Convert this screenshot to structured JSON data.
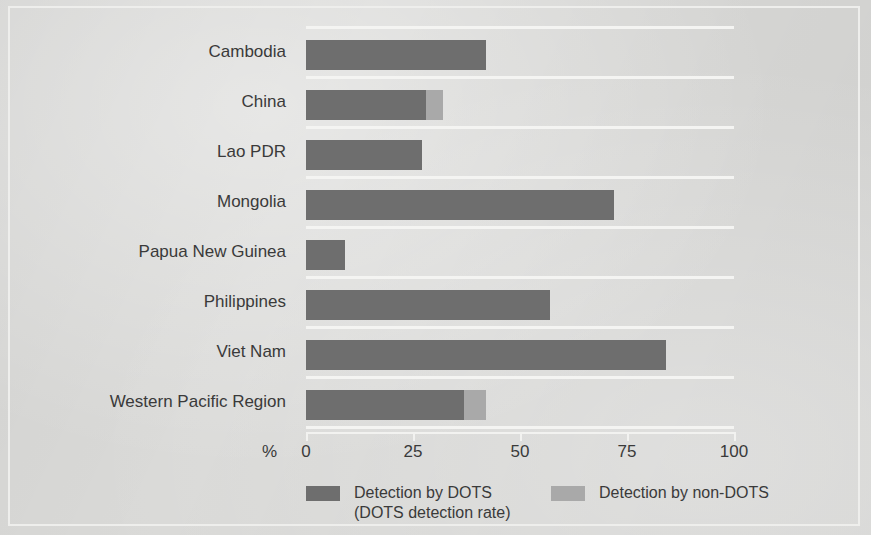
{
  "figure": {
    "background_color": "#d9d9d7",
    "frame_color": "#eeeeec"
  },
  "axis": {
    "unit_label": "%",
    "tick_labels": [
      "0",
      "25",
      "50",
      "75",
      "100"
    ]
  },
  "legend": {
    "items": [
      {
        "label": "Detection by DOTS",
        "sublabel": "(DOTS detection rate)",
        "color": "#6e6e6e",
        "swatch_name": "legend-swatch-dots"
      },
      {
        "label": "Detection by non-DOTS",
        "sublabel": "",
        "color": "#a9a9a9",
        "swatch_name": "legend-swatch-nondots"
      }
    ]
  },
  "chart_data": {
    "type": "bar",
    "orientation": "horizontal",
    "stacked": true,
    "title": "",
    "subtitle": "",
    "xlabel": "%",
    "ylabel": "",
    "xlim": [
      0,
      100
    ],
    "xticks": [
      0,
      25,
      50,
      75,
      100
    ],
    "grid": true,
    "grid_orientation": "horizontal",
    "legend_position": "bottom",
    "categories": [
      "Cambodia",
      "China",
      "Lao PDR",
      "Mongolia",
      "Papua New Guinea",
      "Philippines",
      "Viet Nam",
      "Western Pacific Region"
    ],
    "series": [
      {
        "name": "Detection by DOTS",
        "color": "#6e6e6e",
        "values": [
          42,
          28,
          27,
          72,
          9,
          57,
          84,
          37
        ]
      },
      {
        "name": "Detection by non-DOTS",
        "color": "#a9a9a9",
        "values": [
          0,
          4,
          0,
          0,
          0,
          0,
          0,
          5
        ]
      }
    ],
    "totals": [
      42,
      32,
      27,
      72,
      9,
      57,
      84,
      42
    ]
  }
}
